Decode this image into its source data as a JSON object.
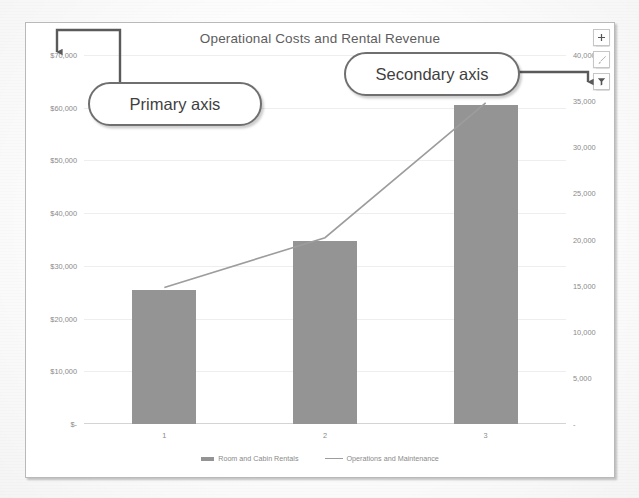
{
  "chart_buttons": [
    {
      "name": "chart-elements-button",
      "glyph": "+"
    },
    {
      "name": "chart-styles-button",
      "glyph": "✎"
    },
    {
      "name": "chart-filters-button",
      "glyph": "▼"
    }
  ],
  "callouts": [
    {
      "id": "primary",
      "label": "Primary axis"
    },
    {
      "id": "secondary",
      "label": "Secondary axis"
    }
  ],
  "chart_data": {
    "type": "bar",
    "title": "Operational Costs and Rental Revenue",
    "xlabel": "",
    "ylabel": "",
    "categories": [
      "1",
      "2",
      "3"
    ],
    "grid": true,
    "legend_position": "bottom",
    "primary_axis": {
      "name": "Primary axis",
      "series": "Room and Cabin Rentals",
      "ylim": [
        0,
        70000
      ],
      "ticks": [
        0,
        10000,
        20000,
        30000,
        40000,
        50000,
        60000,
        70000
      ],
      "tick_labels": [
        "$-",
        "$10,000",
        "$20,000",
        "$30,000",
        "$40,000",
        "$50,000",
        "$60,000",
        "$70,000"
      ]
    },
    "secondary_axis": {
      "name": "Secondary axis",
      "series": "Operations and Maintenance",
      "ylim": [
        0,
        40000
      ],
      "ticks": [
        0,
        5000,
        10000,
        15000,
        20000,
        25000,
        30000,
        35000,
        40000
      ],
      "tick_labels": [
        "-",
        "5,000",
        "10,000",
        "15,000",
        "20,000",
        "25,000",
        "30,000",
        "35,000",
        "40,000"
      ]
    },
    "series": [
      {
        "name": "Room and Cabin Rentals",
        "type": "bar",
        "axis": "primary",
        "color": "#949494",
        "values": [
          25500,
          34700,
          60500
        ]
      },
      {
        "name": "Operations and Maintenance",
        "type": "line",
        "axis": "secondary",
        "color": "#9d9d9d",
        "values": [
          14800,
          20200,
          34800
        ]
      }
    ]
  }
}
